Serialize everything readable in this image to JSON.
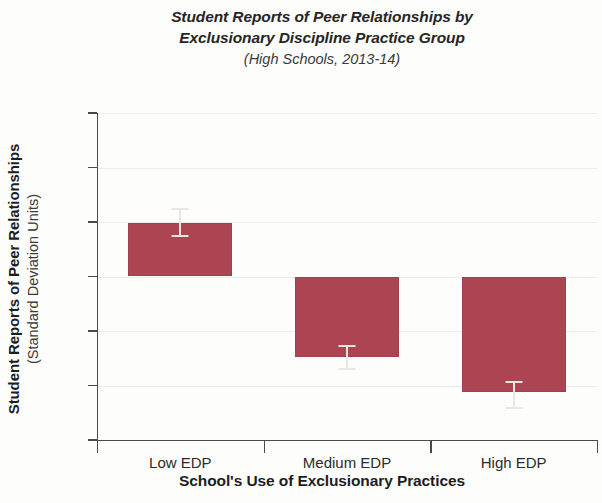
{
  "chart_data": {
    "type": "bar",
    "title": "Student Reports of Peer Relationships by Exclusionary Discipline Practice Group",
    "title_line1": "Student Reports of Peer Relationships by",
    "title_line2": "Exclusionary Discipline Practice Group",
    "subtitle": "(High Schools, 2013-14)",
    "xlabel": "School's Use of Exclusionary Practices",
    "ylabel": "Student Reports of Peer Relationships",
    "ylabel_sub": "(Standard Deviation Units)",
    "categories": [
      "Low EDP",
      "Medium EDP",
      "High EDP"
    ],
    "values": [
      0.49,
      -0.74,
      -1.06
    ],
    "errors_low": [
      0.37,
      -0.85,
      -1.21
    ],
    "errors_high": [
      0.62,
      -0.64,
      -0.97
    ],
    "ylim": [
      -1.5,
      1.5
    ],
    "yticks": [
      1.5,
      1.0,
      0.5,
      0,
      -0.5,
      -1.0,
      -1.5
    ],
    "ytick_labels": [
      "1.5",
      "1.0",
      "0.5",
      "0",
      "-0.5",
      "-1.0",
      "-1.5"
    ],
    "grid": true,
    "legend": null,
    "bar_color": "#ac4452",
    "errorbar_color": "#e9e6e4",
    "axis_color": "#4a4a4a"
  }
}
